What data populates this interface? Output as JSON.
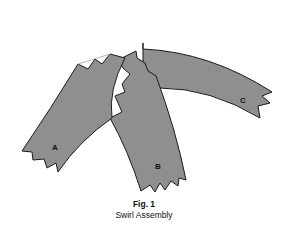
{
  "figure": {
    "number_label": "Fig. 1",
    "title": "Swirl Assembly",
    "fill_color": "#8f8f8f",
    "stroke_color": "#1a1a1a",
    "pieces": [
      {
        "id": "A",
        "label": "A"
      },
      {
        "id": "B",
        "label": "B"
      },
      {
        "id": "C",
        "label": "C"
      }
    ]
  }
}
